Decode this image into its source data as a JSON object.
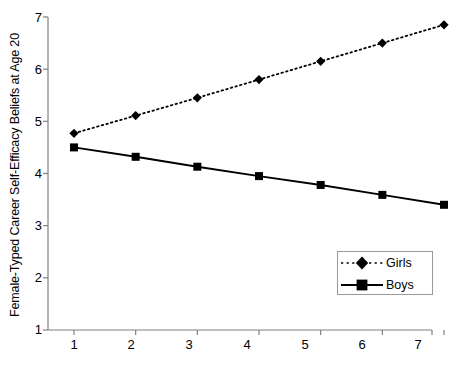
{
  "chart_data": {
    "type": "line",
    "title": "",
    "xlabel": "Mothers' Traditional Gender Role Attitudes at Age 12",
    "ylabel": "Female-Typed Career Self-Efficacy Beliefs at Age 20",
    "x": [
      1,
      2,
      3,
      4,
      5,
      6,
      7
    ],
    "xticklabels": [
      "1",
      "2",
      "3",
      "4",
      "5",
      "6",
      "7"
    ],
    "yticklabels": [
      "1",
      "2",
      "3",
      "4",
      "5",
      "6",
      "7"
    ],
    "xlim": [
      1,
      7
    ],
    "ylim": [
      1,
      7
    ],
    "grid": false,
    "legend_position": "lower-right",
    "series": [
      {
        "name": "Girls",
        "values": [
          4.77,
          5.11,
          5.45,
          5.8,
          6.15,
          6.5,
          6.85
        ],
        "line_style": "dotted",
        "marker": "diamond",
        "color": "#000000"
      },
      {
        "name": "Boys",
        "values": [
          4.5,
          4.32,
          4.13,
          3.95,
          3.78,
          3.59,
          3.4
        ],
        "line_style": "solid",
        "marker": "square",
        "color": "#000000"
      }
    ]
  },
  "legend": {
    "items": [
      {
        "label": "Girls"
      },
      {
        "label": "Boys"
      }
    ]
  },
  "axes": {
    "line_color": "#808080",
    "background": "#ffffff"
  }
}
